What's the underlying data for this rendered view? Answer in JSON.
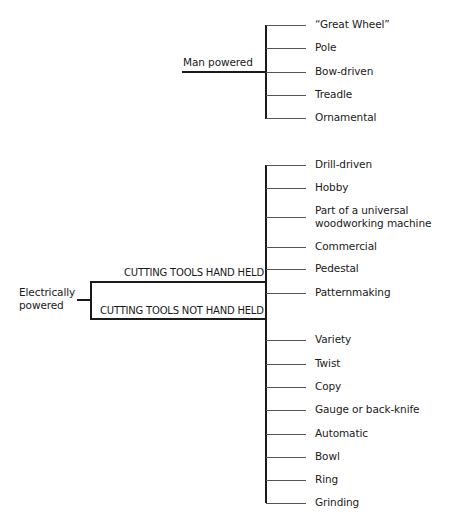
{
  "man_powered": {
    "label": "Man powered",
    "items": [
      "“Great Wheel”",
      "Pole",
      "Bow-driven",
      "Treadle",
      "Ornamental"
    ]
  },
  "electrically_powered": {
    "label_line1": "Electrically",
    "label_line2": "powered",
    "branch_hand_held": "CUTTING TOOLS HAND HELD",
    "branch_not_hand_held": "CUTTING TOOLS NOT HAND HELD",
    "items": [
      "Drill-driven",
      "Hobby",
      "Part of a universal",
      "woodworking machine",
      "Commercial",
      "Pedestal",
      "Patternmaking",
      "Variety",
      "Twist",
      "Copy",
      "Gauge or back-knife",
      "Automatic",
      "Bowl",
      "Ring",
      "Grinding"
    ]
  }
}
